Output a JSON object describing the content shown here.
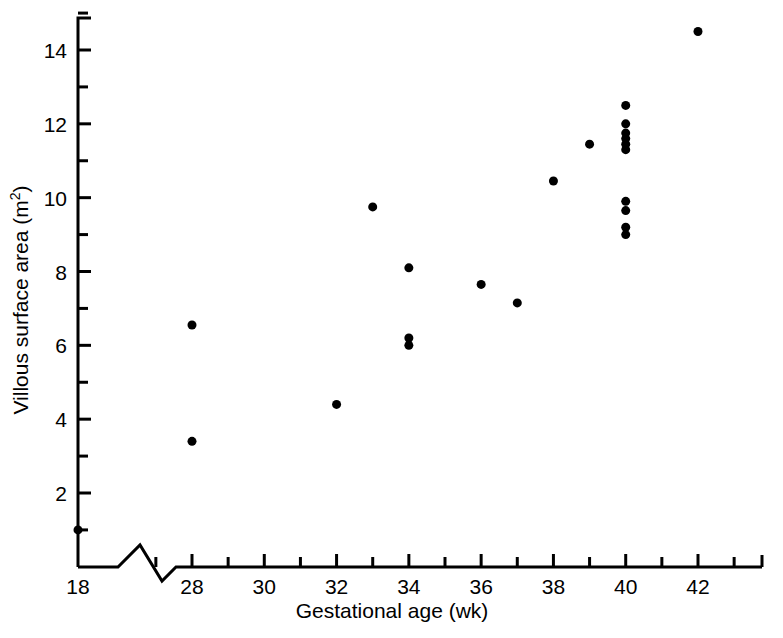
{
  "figure": {
    "background_color": "#ffffff",
    "ink_color": "#000000"
  },
  "chart_data": {
    "type": "scatter",
    "title": "",
    "xlabel": "Gestational age (wk)",
    "ylabel_main": "Villous surface area (m",
    "ylabel_unit_sup": "2",
    "ylabel_close": ")",
    "ylabel_full": "Villous surface area (m2)",
    "xlim": [
      18,
      43
    ],
    "ylim": [
      0,
      15
    ],
    "x_axis_break": {
      "present": true,
      "between": [
        18,
        27
      ],
      "symbol": "zigzag"
    },
    "grid": false,
    "legend": null,
    "x_ticks_major": [
      18,
      28,
      30,
      32,
      34,
      36,
      38,
      40,
      42
    ],
    "x_tick_labels": [
      "18",
      "28",
      "30",
      "32",
      "34",
      "36",
      "38",
      "40",
      "42"
    ],
    "x_ticks_minor": [
      27,
      29,
      31,
      33,
      35,
      37,
      39,
      41,
      43
    ],
    "y_ticks_major": [
      2,
      4,
      6,
      8,
      10,
      12,
      14
    ],
    "y_tick_labels": [
      "2",
      "4",
      "6",
      "8",
      "10",
      "12",
      "14"
    ],
    "y_ticks_minor": [
      1,
      3,
      5,
      7,
      9,
      11,
      13,
      15
    ],
    "marker": {
      "shape": "filled-circle",
      "color": "#000000",
      "size_px": 9
    },
    "points": [
      {
        "x": 18,
        "y": 1.0
      },
      {
        "x": 28,
        "y": 6.55
      },
      {
        "x": 28,
        "y": 3.4
      },
      {
        "x": 32,
        "y": 4.4
      },
      {
        "x": 33,
        "y": 9.75
      },
      {
        "x": 34,
        "y": 8.1
      },
      {
        "x": 34,
        "y": 6.2
      },
      {
        "x": 34,
        "y": 6.0
      },
      {
        "x": 36,
        "y": 7.65
      },
      {
        "x": 37,
        "y": 7.15
      },
      {
        "x": 38,
        "y": 10.45
      },
      {
        "x": 39,
        "y": 11.45
      },
      {
        "x": 40,
        "y": 12.5
      },
      {
        "x": 40,
        "y": 12.0
      },
      {
        "x": 40,
        "y": 11.75
      },
      {
        "x": 40,
        "y": 11.6
      },
      {
        "x": 40,
        "y": 11.45
      },
      {
        "x": 40,
        "y": 11.3
      },
      {
        "x": 40,
        "y": 9.9
      },
      {
        "x": 40,
        "y": 9.65
      },
      {
        "x": 40,
        "y": 9.2
      },
      {
        "x": 40,
        "y": 9.0
      },
      {
        "x": 42,
        "y": 14.5
      }
    ],
    "n_points": 23
  }
}
